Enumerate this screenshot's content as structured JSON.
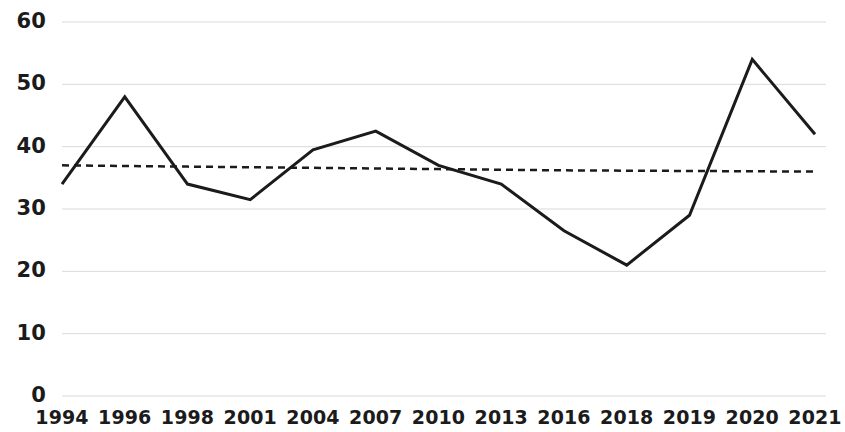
{
  "chart_data": {
    "type": "line",
    "title": "",
    "subtitle": "",
    "xlabel": "",
    "ylabel": "",
    "categories": [
      "1994",
      "1996",
      "1998",
      "2001",
      "2004",
      "2007",
      "2010",
      "2013",
      "2016",
      "2018",
      "2019",
      "2020",
      "2021"
    ],
    "series": [
      {
        "name": "Value",
        "values": [
          34,
          48,
          34,
          31.5,
          39.5,
          42.5,
          37,
          34,
          26.5,
          21,
          29,
          54,
          42
        ],
        "color": "#1b1b1b",
        "style": "solid",
        "width": 3
      },
      {
        "name": "Trend",
        "values": [
          37,
          36.9,
          36.8,
          36.7,
          36.6,
          36.5,
          36.4,
          36.3,
          36.2,
          36.15,
          36.1,
          36.05,
          36
        ],
        "color": "#1b1b1b",
        "style": "dashed",
        "width": 2.5
      }
    ],
    "ylim": [
      0,
      60
    ],
    "yticks": [
      0,
      10,
      20,
      30,
      40,
      50,
      60
    ],
    "ytick_labels": [
      "0",
      "10",
      "20",
      "30",
      "40",
      "50",
      "60"
    ],
    "xtick_labels": [
      "1994",
      "1996",
      "1998",
      "2001",
      "2004",
      "2007",
      "2010",
      "2013",
      "2016",
      "2018",
      "2019",
      "2020",
      "2021"
    ],
    "grid": true,
    "grid_axis": "y",
    "grid_color": "#d9d9d9",
    "legend": false,
    "legend_position": "none",
    "background": "#ffffff"
  },
  "plot": {
    "left": 62,
    "right": 815,
    "top": 22,
    "bottom": 396
  }
}
